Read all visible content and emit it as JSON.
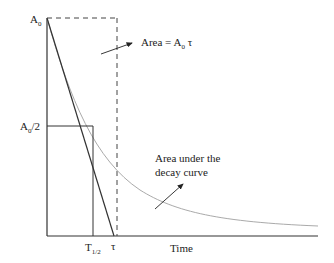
{
  "diagram": {
    "y_axis_top_label": {
      "main": "A",
      "sub": "0"
    },
    "half_label": {
      "main": "A",
      "sub": "0",
      "suffix": "/2"
    },
    "area_label": {
      "prefix": "Area = A",
      "sub": "0",
      "suffix": " τ"
    },
    "curve_label_line1": "Area under the",
    "curve_label_line2": "decay curve",
    "t_half_label": {
      "main": "T",
      "sub": "1/2"
    },
    "tau_label": "τ",
    "x_axis_label": "Time",
    "colors": {
      "axis": "#333333",
      "tangent": "#333333",
      "curve": "#aaaaaa",
      "dashed": "#444444"
    }
  }
}
